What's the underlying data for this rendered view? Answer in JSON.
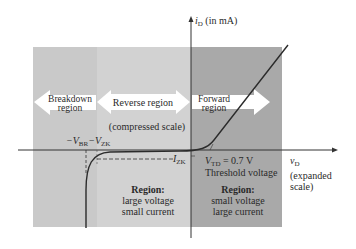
{
  "colors": {
    "breakdown_bg": "#c9c9c9",
    "reverse_bg": "#d2d2d2",
    "forward_bg": "#a9a9a9",
    "arrow_fill": "#ffffff",
    "curve": "#2b2b2b",
    "axis": "#333333"
  },
  "axes": {
    "y_label": "i",
    "y_label_sub": "D",
    "y_label_unit": "(in mA)",
    "x_label": "v",
    "x_label_sub": "D",
    "x_label_note_1": "(expanded",
    "x_label_note_2": "scale)"
  },
  "regions": {
    "breakdown": {
      "line1": "Breakdown",
      "line2": "region"
    },
    "reverse": {
      "label": "Reverse region",
      "note": "(compressed scale)"
    },
    "forward": {
      "line1": "Forward",
      "line2": "region"
    }
  },
  "annotations": {
    "vbr": "−V",
    "vbr_sub": "BR",
    "vzk": "−V",
    "vzk_sub": "ZK",
    "izk": "I",
    "izk_sub": "ZK",
    "vtd": "V",
    "vtd_sub": "TD",
    "vtd_value": " = 0.7 V",
    "threshold": "Threshold voltage"
  },
  "region_notes": {
    "reverse": {
      "title": "Region:",
      "line1": "large voltage",
      "line2": "small current"
    },
    "forward": {
      "title": "Region:",
      "line1": "small voltage",
      "line2": "large current"
    }
  }
}
